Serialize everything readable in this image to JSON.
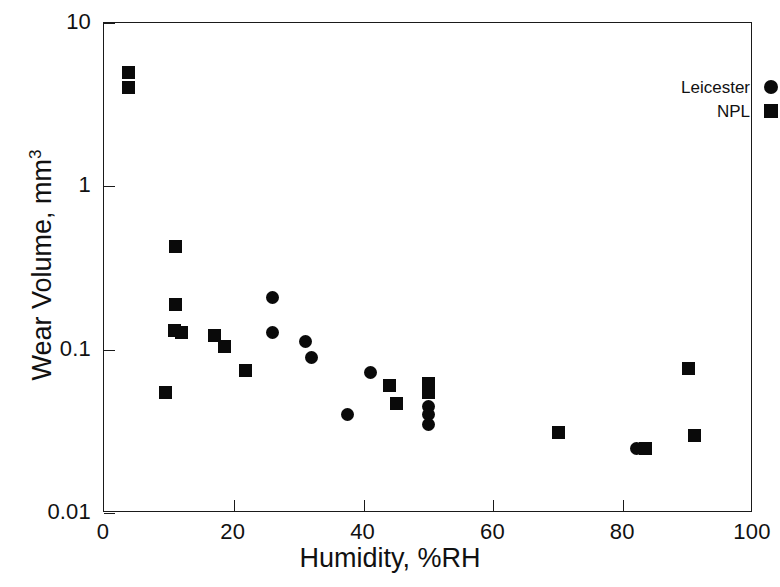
{
  "chart_data": {
    "type": "scatter",
    "title": "",
    "xlabel": "Humidity, %RH",
    "ylabel": "Wear Volume, mm3",
    "ylabel_base": "Wear Volume, mm",
    "ylabel_exponent": "3",
    "xlim": [
      0,
      100
    ],
    "ylim": [
      0.01,
      10
    ],
    "yscale": "log",
    "xscale": "linear",
    "grid": false,
    "legend_position": "top-right",
    "xticks": [
      "0",
      "20",
      "40",
      "60",
      "80",
      "100"
    ],
    "xtick_values": [
      0,
      20,
      40,
      60,
      80,
      100
    ],
    "yticks": [
      "0.01",
      "0.1",
      "1",
      "10"
    ],
    "ytick_values": [
      0.01,
      0.1,
      1,
      10
    ],
    "series": [
      {
        "name": "Leicester",
        "marker": "circle",
        "color": "#0a0a0a",
        "points": [
          {
            "x": 26.0,
            "y": 0.21
          },
          {
            "x": 26.0,
            "y": 0.127
          },
          {
            "x": 31.0,
            "y": 0.112
          },
          {
            "x": 32.0,
            "y": 0.089
          },
          {
            "x": 37.5,
            "y": 0.04
          },
          {
            "x": 41.0,
            "y": 0.072
          },
          {
            "x": 50.0,
            "y": 0.045
          },
          {
            "x": 50.0,
            "y": 0.04
          },
          {
            "x": 50.0,
            "y": 0.035
          },
          {
            "x": 82.0,
            "y": 0.025
          }
        ]
      },
      {
        "name": "NPL",
        "marker": "square",
        "color": "#0a0a0a",
        "points": [
          {
            "x": 3.8,
            "y": 5.0
          },
          {
            "x": 3.8,
            "y": 4.0
          },
          {
            "x": 9.5,
            "y": 0.055
          },
          {
            "x": 11.0,
            "y": 0.43
          },
          {
            "x": 11.0,
            "y": 0.19
          },
          {
            "x": 10.8,
            "y": 0.131
          },
          {
            "x": 12.0,
            "y": 0.128
          },
          {
            "x": 17.0,
            "y": 0.122
          },
          {
            "x": 18.5,
            "y": 0.105
          },
          {
            "x": 21.8,
            "y": 0.075
          },
          {
            "x": 44.0,
            "y": 0.06
          },
          {
            "x": 45.0,
            "y": 0.047
          },
          {
            "x": 50.0,
            "y": 0.062
          },
          {
            "x": 50.0,
            "y": 0.055
          },
          {
            "x": 70.0,
            "y": 0.031
          },
          {
            "x": 83.5,
            "y": 0.025
          },
          {
            "x": 90.0,
            "y": 0.077
          },
          {
            "x": 91.0,
            "y": 0.03
          }
        ]
      }
    ]
  },
  "legend": {
    "entries": [
      {
        "label": "Leicester",
        "marker": "circle"
      },
      {
        "label": "NPL",
        "marker": "square"
      }
    ]
  }
}
